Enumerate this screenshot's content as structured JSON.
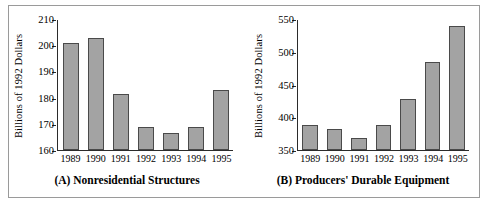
{
  "figure": {
    "bar_fill_color": "#a3a3a3",
    "bar_border_color": "#4a4a4a",
    "axis_color": "#2b2b2b",
    "frame_color": "#9a9a9a"
  },
  "chart_data": [
    {
      "type": "bar",
      "title": "(A) Nonresidential Structures",
      "xlabel": "",
      "ylabel": "Billions of 1992 Dollars",
      "categories": [
        "1989",
        "1990",
        "1991",
        "1992",
        "1993",
        "1994",
        "1995"
      ],
      "values": [
        201,
        203,
        181.5,
        169,
        166.5,
        169,
        183
      ],
      "ylim": [
        160,
        210
      ],
      "yticks": [
        160,
        170,
        180,
        190,
        200,
        210
      ],
      "ytick_labels": [
        "160",
        "170",
        "180",
        "190",
        "200",
        "210"
      ],
      "grid": false,
      "legend": "none"
    },
    {
      "type": "bar",
      "title": "(B) Producers' Durable Equipment",
      "xlabel": "",
      "ylabel": "Billions of 1992 Dollars",
      "categories": [
        "1989",
        "1990",
        "1991",
        "1992",
        "1993",
        "1994",
        "1995"
      ],
      "values": [
        388,
        383,
        368,
        389,
        429,
        485,
        541
      ],
      "ylim": [
        350,
        550
      ],
      "yticks": [
        350,
        400,
        450,
        500,
        550
      ],
      "ytick_labels": [
        "350",
        "400",
        "450",
        "500",
        "550"
      ],
      "grid": false,
      "legend": "none"
    }
  ]
}
